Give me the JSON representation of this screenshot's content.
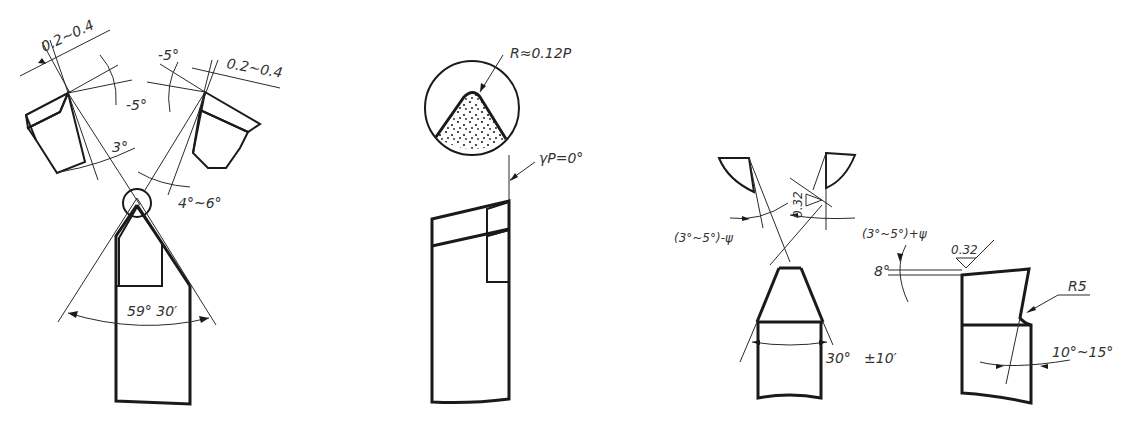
{
  "figure": {
    "type": "technical-drawing",
    "views": [
      {
        "id": "view-1-cemented-carbide-thread-tool",
        "labels": {
          "land_width_left": "0.2~0.4",
          "land_width_right": "0.2~0.4",
          "rake_left": "-5°",
          "rake_right": "-5°",
          "clearance_left": "3°",
          "clearance_right": "4°~6°",
          "tool_angle": "59° 30′"
        }
      },
      {
        "id": "view-2-detail-tip-radius",
        "labels": {
          "tip_radius": "R≈0.12P",
          "rake_angle": "γP=0°"
        }
      },
      {
        "id": "view-3-high-speed-steel-thread-tool",
        "labels": {
          "left_side_clearance": "(3°~5°)-ψ",
          "right_side_clearance": "(3°~5°)+ψ",
          "roughness_flank": "0.32",
          "roughness_top": "0.32",
          "tool_angle": "30°",
          "tolerance": "±10′",
          "top_rake": "8°",
          "fillet": "R5",
          "clearance_front": "10°~15°"
        }
      }
    ]
  }
}
